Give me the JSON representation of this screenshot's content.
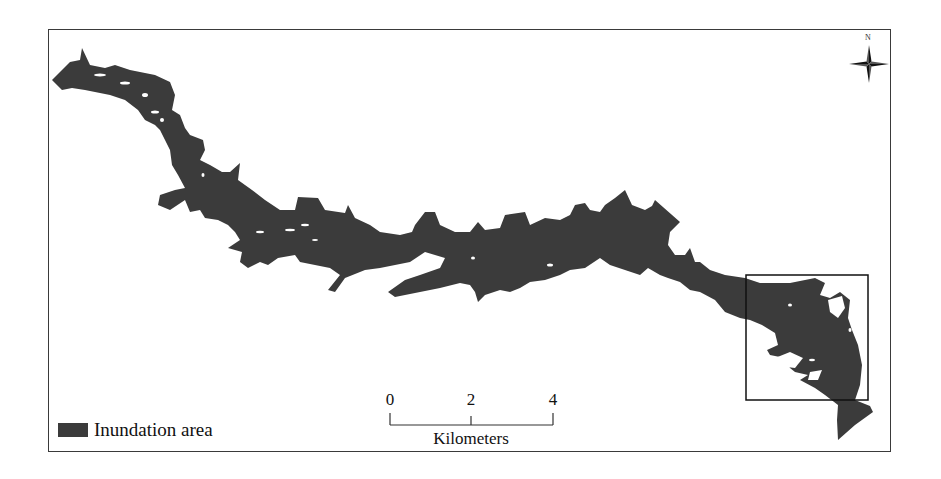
{
  "map": {
    "fill_color": "#3b3b3b",
    "frame_color": "#3a3a3a",
    "inset_box": {
      "x": 746,
      "y": 275,
      "width": 122,
      "height": 125,
      "stroke": "#111111"
    }
  },
  "legend": {
    "items": [
      {
        "label": "Inundation area",
        "color": "#3b3b3b"
      }
    ]
  },
  "scale_bar": {
    "ticks": [
      {
        "label": "0",
        "x": 390
      },
      {
        "label": "2",
        "x": 471
      },
      {
        "label": "4",
        "x": 553
      }
    ],
    "unit": "Kilometers"
  },
  "north_arrow": {
    "label": "N"
  }
}
